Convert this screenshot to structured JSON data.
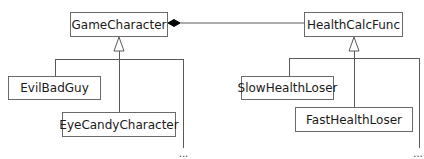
{
  "diagram": {
    "type": "UML class diagram",
    "classes": {
      "game_character": "GameCharacter",
      "health_calc_func": "HealthCalcFunc",
      "evil_bad_guy": "EvilBadGuy",
      "eye_candy_character": "EyeCandyCharacter",
      "slow_health_loser": "SlowHealthLoser",
      "fast_health_loser": "FastHealthLoser"
    },
    "relationships": [
      {
        "type": "composition",
        "whole": "GameCharacter",
        "part": "HealthCalcFunc"
      },
      {
        "type": "inheritance",
        "parent": "GameCharacter",
        "children": [
          "EvilBadGuy",
          "EyeCandyCharacter",
          "..."
        ]
      },
      {
        "type": "inheritance",
        "parent": "HealthCalcFunc",
        "children": [
          "SlowHealthLoser",
          "FastHealthLoser",
          "..."
        ]
      }
    ],
    "ellipsis": "..."
  }
}
